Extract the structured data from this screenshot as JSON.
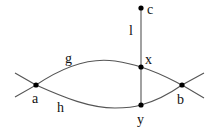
{
  "diagram": {
    "nodes": {
      "a": {
        "label": "a"
      },
      "b": {
        "label": "b"
      },
      "c": {
        "label": "c"
      },
      "x": {
        "label": "x"
      },
      "y": {
        "label": "y"
      }
    },
    "edges": {
      "g": {
        "label": "g",
        "from": "a",
        "to": "b",
        "via": "x"
      },
      "h": {
        "label": "h",
        "from": "a",
        "to": "b",
        "via": "y"
      },
      "l": {
        "label": "l",
        "from": "c",
        "to": "y"
      }
    },
    "colors": {
      "stroke": "#555555",
      "node": "#000000"
    }
  }
}
